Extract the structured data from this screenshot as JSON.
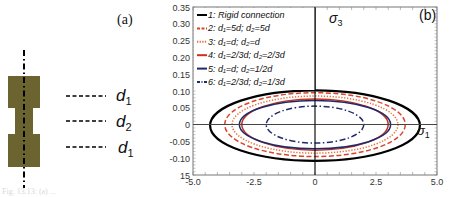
{
  "figure": {
    "panel_a": {
      "label": "(a)",
      "specimen_color": "#6b6431",
      "dimension_labels": [
        {
          "name": "d",
          "sub": "1"
        },
        {
          "name": "d",
          "sub": "2"
        },
        {
          "name": "d",
          "sub": "1"
        }
      ]
    },
    "panel_b": {
      "label": "(b)",
      "axis_label_y": "σ",
      "axis_label_y_sub": "3",
      "axis_label_x": "σ",
      "axis_label_x_sub": "1"
    },
    "caption": "Fig. 13.13: (a) ..."
  },
  "chart_data": {
    "type": "line",
    "title": "",
    "xlabel": "σ1",
    "ylabel": "σ3",
    "xlim": [
      -5.0,
      5.0
    ],
    "ylim": [
      -0.15,
      0.35
    ],
    "x_ticks": [
      "-5.0",
      "-2.5",
      "0",
      "2.5",
      "5.0"
    ],
    "y_ticks": [
      "0.35",
      "0.30",
      "0.25",
      "0.20",
      "0.15",
      "0.10",
      "0.05",
      "0",
      "-0.05",
      "-0.10",
      "15"
    ],
    "grid": false,
    "legend_position": "upper-left",
    "series": [
      {
        "name": "1: Rigid connection",
        "color": "#000000",
        "style": "solid",
        "shape": "ellipse",
        "semi_axis_x": 4.3,
        "semi_axis_y": 0.105
      },
      {
        "name": "2: d1=5d; d2=5d",
        "color": "#d9452b",
        "style": "dashed",
        "shape": "ellipse",
        "semi_axis_x": 3.7,
        "semi_axis_y": 0.095
      },
      {
        "name": "3: d1=d; d2=d",
        "color": "#e8703a",
        "style": "dotted",
        "shape": "ellipse",
        "semi_axis_x": 3.4,
        "semi_axis_y": 0.085
      },
      {
        "name": "4: d1=2/3d; d2=2/3d",
        "color": "#c8321e",
        "style": "solid",
        "shape": "ellipse",
        "semi_axis_x": 3.0,
        "semi_axis_y": 0.076
      },
      {
        "name": "5: d1=d; d2=1/2d",
        "color": "#1f2a6b",
        "style": "solid",
        "shape": "ellipse",
        "semi_axis_x": 3.1,
        "semi_axis_y": 0.072
      },
      {
        "name": "6: d1=2/3d; d2=1/3d",
        "color": "#1f2a6b",
        "style": "dash-dot",
        "shape": "ellipse",
        "semi_axis_x": 2.0,
        "semi_axis_y": 0.055
      }
    ]
  },
  "legend": [
    {
      "num": "1:",
      "text": "Rigid connection"
    },
    {
      "num": "2:",
      "text": "d₁=5d; d₂=5d"
    },
    {
      "num": "3:",
      "text": "d₁=d; d₂=d"
    },
    {
      "num": "4:",
      "text": "d₁=2/3d; d₂=2/3d"
    },
    {
      "num": "5:",
      "text": "d₁=d; d₂=1/2d"
    },
    {
      "num": "6:",
      "text": "d₁=2/3d; d₂=1/3d"
    }
  ]
}
